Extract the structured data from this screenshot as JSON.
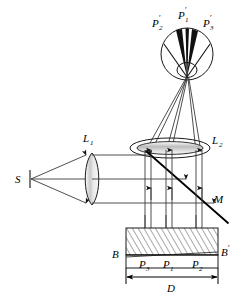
{
  "figure": {
    "background_color": "#ffffff",
    "ink_color": "#1a1a1a",
    "ray_color": "#3a3a3a"
  },
  "labels": {
    "source": "S",
    "lens1": "L",
    "lens1_sub": "1",
    "lens2": "L",
    "lens2_sub": "2",
    "mirror": "M",
    "eye_p1": "P",
    "eye_p1_sub": "1",
    "eye_p1_prime": "′",
    "eye_p2": "P",
    "eye_p2_sub": "2",
    "eye_p2_prime": "′",
    "eye_p3": "P",
    "eye_p3_sub": "3",
    "eye_p3_prime": "′",
    "sample_left": "B",
    "sample_right": "B",
    "sample_right_prime": "′",
    "point_p3": "P",
    "point_p3_sub": "3",
    "point_p1": "P",
    "point_p1_sub": "1",
    "point_p2": "P",
    "point_p2_sub": "2",
    "dimension_d": "D"
  },
  "elements": {
    "source_name": "point-source",
    "lens1_name": "condenser-lens",
    "lens2_name": "objective-lens",
    "mirror_name": "beam-splitter",
    "eye_name": "observer-eye",
    "sample_name": "hatched-sample-block",
    "dimension_name": "width-dimension"
  }
}
